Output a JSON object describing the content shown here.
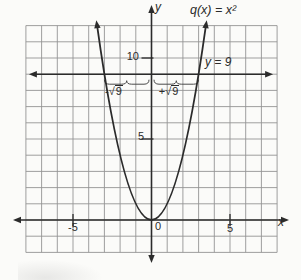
{
  "figure": {
    "labels": {
      "y_axis": "y",
      "x_axis": "x",
      "function": "q(x) = x²",
      "line": "y = 9",
      "origin": "0",
      "y_tick_10": "10",
      "y_tick_5": "5",
      "x_tick_neg5": "-5",
      "x_tick_5": "5",
      "neg_root": {
        "prefix": "-√",
        "radicand": "9"
      },
      "pos_root": {
        "prefix": "+√",
        "radicand": "9"
      }
    },
    "colors": {
      "axis": "#2b2b2b",
      "grid": "#949494",
      "background": "#fbfbf9",
      "text": "#2b2b2b",
      "brace": "#4a4a4a"
    }
  },
  "chart_data": {
    "type": "line",
    "xlabel": "x",
    "ylabel": "y",
    "xlim": [
      -8,
      8
    ],
    "ylim": [
      -2,
      12
    ],
    "grid": true,
    "x_ticks_labeled": [
      -5,
      5
    ],
    "y_ticks_labeled": [
      5,
      10
    ],
    "series": [
      {
        "name": "q(x) = x²",
        "kind": "parabola",
        "equation": "y = x^2",
        "x": [
          -3.45,
          -3,
          -2,
          -1,
          0,
          1,
          2,
          3,
          3.45
        ],
        "y": [
          11.9,
          9,
          4,
          1,
          0,
          1,
          4,
          9,
          11.9
        ]
      },
      {
        "name": "y = 9",
        "kind": "horizontal-line",
        "y_value": 9
      }
    ],
    "intersections": [
      {
        "x": -3,
        "y": 9,
        "label": "-√9"
      },
      {
        "x": 3,
        "y": 9,
        "label": "+√9"
      }
    ]
  }
}
